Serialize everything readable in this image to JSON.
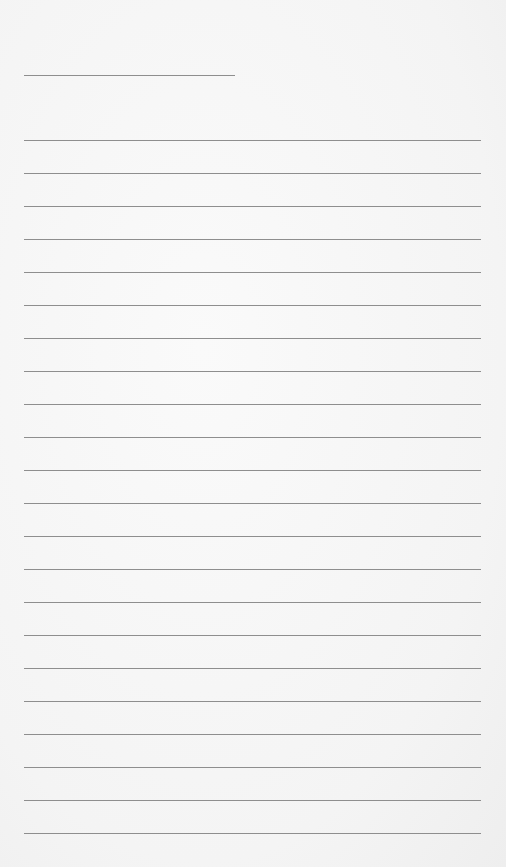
{
  "page": {
    "type": "lined-notepad",
    "background_color": "#f6f6f6",
    "line_color": "#8e8e8e",
    "header_line": {
      "left": 24,
      "top": 75,
      "width": 211
    },
    "ruled_lines": {
      "count": 22,
      "first_top": 140,
      "spacing": 33,
      "left": 24,
      "width": 457
    }
  }
}
